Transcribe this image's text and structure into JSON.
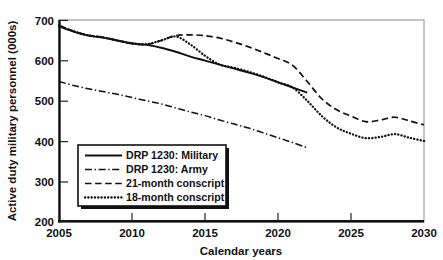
{
  "chart_data": {
    "type": "line",
    "title": "",
    "xlabel": "Calendar years",
    "ylabel": "Active duty military personnel (000s)",
    "xlim": [
      2005,
      2030
    ],
    "ylim": [
      200,
      700
    ],
    "xticks": [
      2005,
      2010,
      2015,
      2020,
      2025,
      2030
    ],
    "yticks": [
      200,
      300,
      400,
      500,
      600,
      700
    ],
    "grid": false,
    "legend_position": "lower-left-inside",
    "colors": {
      "ink": "#111111",
      "background": "#ffffff",
      "frame": "#8c8c8c"
    },
    "series": [
      {
        "name": "DRP 1230: Military",
        "style": "solid",
        "x": [
          2005,
          2006,
          2007,
          2008,
          2009,
          2010,
          2011,
          2012,
          2013,
          2014,
          2015,
          2016,
          2017,
          2018,
          2019,
          2020,
          2021,
          2022
        ],
        "values": [
          685,
          672,
          662,
          657,
          650,
          643,
          639,
          632,
          622,
          610,
          600,
          590,
          580,
          570,
          559,
          546,
          533,
          520
        ]
      },
      {
        "name": "DRP 1230: Army",
        "style": "dash-dot",
        "x": [
          2005,
          2006,
          2007,
          2008,
          2009,
          2010,
          2011,
          2012,
          2013,
          2014,
          2015,
          2016,
          2017,
          2018,
          2019,
          2020,
          2021,
          2022
        ],
        "values": [
          548,
          538,
          530,
          523,
          516,
          508,
          500,
          492,
          482,
          472,
          463,
          452,
          442,
          432,
          420,
          408,
          396,
          383
        ]
      },
      {
        "name": "21-month conscript",
        "style": "dashed",
        "x": [
          2005,
          2006,
          2007,
          2008,
          2009,
          2010,
          2011,
          2012,
          2013,
          2014,
          2015,
          2016,
          2017,
          2018,
          2019,
          2020,
          2021,
          2022,
          2023,
          2024,
          2025,
          2026,
          2027,
          2028,
          2029,
          2030
        ],
        "values": [
          688,
          673,
          663,
          658,
          650,
          642,
          640,
          650,
          662,
          664,
          662,
          656,
          646,
          634,
          620,
          605,
          588,
          548,
          505,
          478,
          462,
          448,
          452,
          459,
          450,
          440
        ]
      },
      {
        "name": "18-month conscript",
        "style": "dotted",
        "x": [
          2005,
          2006,
          2007,
          2008,
          2009,
          2010,
          2011,
          2012,
          2013,
          2014,
          2015,
          2016,
          2017,
          2018,
          2019,
          2020,
          2021,
          2022,
          2023,
          2024,
          2025,
          2026,
          2027,
          2028,
          2029,
          2030
        ],
        "values": [
          687,
          673,
          663,
          658,
          650,
          643,
          641,
          650,
          660,
          640,
          612,
          590,
          582,
          572,
          560,
          546,
          533,
          500,
          462,
          434,
          418,
          407,
          410,
          417,
          408,
          400
        ]
      }
    ]
  },
  "axes": {
    "y_title": "Active duty military personnel (000s)",
    "x_title": "Calendar years",
    "y_tick_labels": [
      "700",
      "600",
      "500",
      "400",
      "300",
      "200"
    ],
    "x_tick_labels": [
      "2005",
      "2010",
      "2015",
      "2020",
      "2025",
      "2030"
    ]
  },
  "legend": {
    "entries": [
      {
        "label": "DRP 1230: Military",
        "style": "solid"
      },
      {
        "label": "DRP 1230: Army",
        "style": "dash-dot"
      },
      {
        "label": "21-month conscript",
        "style": "dashed"
      },
      {
        "label": "18-month conscript",
        "style": "dotted"
      }
    ]
  }
}
